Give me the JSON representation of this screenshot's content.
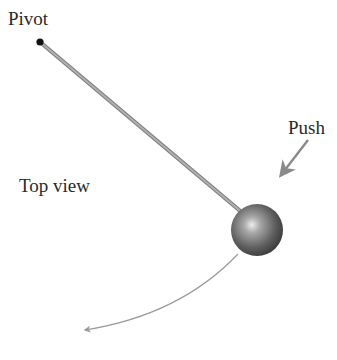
{
  "labels": {
    "pivot": "Pivot",
    "push": "Push",
    "top_view": "Top view"
  },
  "colors": {
    "rod": "#9a9a9a",
    "rod_edge": "#7a7a7a",
    "pivot_dot": "#111111",
    "ball_dark": "#3a3a3a",
    "ball_mid": "#777777",
    "ball_highlight": "#e8e8e8",
    "arrow": "#8a8a8a",
    "text": "#2a2a2a",
    "background": "#ffffff"
  },
  "geometry": {
    "pivot": {
      "x": 40,
      "y": 42
    },
    "ball": {
      "cx": 257,
      "cy": 230,
      "r": 26
    },
    "push_arrow": {
      "x1": 308,
      "y1": 140,
      "x2": 279,
      "y2": 178
    },
    "motion_arc": {
      "x1": 238,
      "y1": 254,
      "x2": 82,
      "y2": 331
    }
  }
}
